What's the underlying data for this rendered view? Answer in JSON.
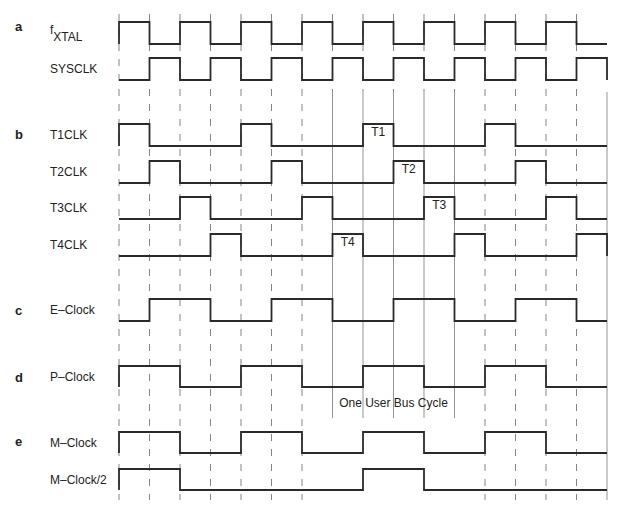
{
  "diagram": {
    "sections": [
      {
        "letter": "a",
        "y": 31
      },
      {
        "letter": "b",
        "y": 139
      },
      {
        "letter": "c",
        "y": 315
      },
      {
        "letter": "d",
        "y": 382
      },
      {
        "letter": "e",
        "y": 446
      }
    ],
    "grid": {
      "x0": 119,
      "slot_width": 30.5,
      "slots": 16,
      "solid_lines_slots": [
        7,
        8,
        9,
        10,
        11,
        16
      ]
    },
    "signals": [
      {
        "id": "fxtal",
        "label": "f",
        "label_sub": "XTAL",
        "high_y": 22,
        "low_y": 44,
        "levels": [
          1,
          0,
          1,
          0,
          1,
          0,
          1,
          0,
          1,
          0,
          1,
          0,
          1,
          0,
          1,
          0
        ]
      },
      {
        "id": "sysclk",
        "label": "SYSCLK",
        "high_y": 58,
        "low_y": 80,
        "levels": [
          0,
          1,
          0,
          1,
          0,
          1,
          0,
          1,
          0,
          1,
          0,
          1,
          0,
          1,
          0,
          1
        ]
      },
      {
        "id": "t1clk",
        "label": "T1CLK",
        "high_y": 124,
        "low_y": 146,
        "levels": [
          1,
          0,
          0,
          0,
          1,
          0,
          0,
          0,
          1,
          0,
          0,
          0,
          1,
          0,
          0,
          0
        ],
        "tag": "T1",
        "tag_slot": 8
      },
      {
        "id": "t2clk",
        "label": "T2CLK",
        "high_y": 161,
        "low_y": 183,
        "levels": [
          0,
          1,
          0,
          0,
          0,
          1,
          0,
          0,
          0,
          1,
          0,
          0,
          0,
          1,
          0,
          0
        ],
        "tag": "T2",
        "tag_slot": 9
      },
      {
        "id": "t3clk",
        "label": "T3CLK",
        "high_y": 197,
        "low_y": 219,
        "levels": [
          0,
          0,
          1,
          0,
          0,
          0,
          1,
          0,
          0,
          0,
          1,
          0,
          0,
          0,
          1,
          0
        ],
        "tag": "T3",
        "tag_slot": 10
      },
      {
        "id": "t4clk",
        "label": "T4CLK",
        "high_y": 234,
        "low_y": 256,
        "levels": [
          0,
          0,
          0,
          1,
          0,
          0,
          0,
          1,
          0,
          0,
          0,
          1,
          0,
          0,
          0,
          1
        ],
        "tag": "T4",
        "tag_slot": 7
      },
      {
        "id": "eclock",
        "label": "E–Clock",
        "high_y": 299,
        "low_y": 321,
        "levels": [
          0,
          1,
          1,
          0,
          0,
          1,
          1,
          0,
          0,
          1,
          1,
          0,
          0,
          1,
          1,
          0
        ]
      },
      {
        "id": "pclock",
        "label": "P–Clock",
        "high_y": 366,
        "low_y": 387,
        "levels": [
          1,
          1,
          0,
          0,
          1,
          1,
          0,
          0,
          1,
          1,
          0,
          0,
          1,
          1,
          0,
          0
        ]
      },
      {
        "id": "mclock",
        "label": "M–Clock",
        "high_y": 432,
        "low_y": 453,
        "levels": [
          1,
          1,
          0,
          0,
          1,
          1,
          0,
          0,
          1,
          1,
          0,
          0,
          1,
          1,
          0,
          0
        ]
      },
      {
        "id": "mclock2",
        "label": "M–Clock/2",
        "high_y": 469,
        "low_y": 490,
        "levels": [
          1,
          1,
          0,
          0,
          0,
          0,
          0,
          0,
          1,
          1,
          0,
          0,
          0,
          0,
          0,
          0
        ]
      }
    ],
    "annotation": {
      "label": "One User Bus Cycle",
      "start_slot": 7,
      "end_slot": 11,
      "y": 407
    }
  }
}
